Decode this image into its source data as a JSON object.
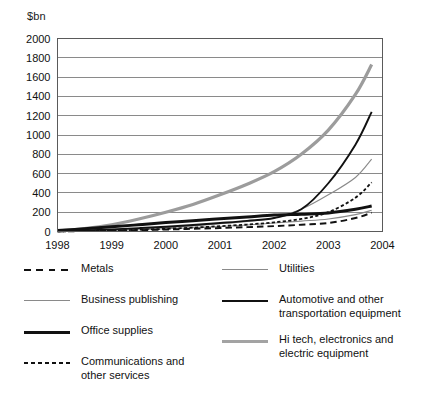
{
  "chart_data": {
    "type": "line",
    "title": "",
    "subtitle": "",
    "xlabel": "",
    "ylabel": "$bn",
    "grid": true,
    "legend_position": "bottom",
    "xlim": [
      1998,
      2004
    ],
    "ylim": [
      0,
      2000
    ],
    "x_ticks": [
      "1998",
      "1999",
      "2000",
      "2001",
      "2002",
      "2003",
      "2004"
    ],
    "y_ticks": [
      "0",
      "200",
      "400",
      "600",
      "800",
      "1000",
      "1200",
      "1400",
      "1600",
      "1800",
      "2000"
    ],
    "x": [
      1998,
      1998.5,
      1999,
      1999.5,
      2000,
      2000.5,
      2001,
      2001.5,
      2002,
      2002.5,
      2003,
      2003.5,
      2003.8
    ],
    "series": [
      {
        "name": "Hi tech, electronics and electric equipment",
        "style": "solid",
        "color": "#9c9c9c",
        "width": 3.2,
        "values": [
          5,
          30,
          70,
          130,
          200,
          280,
          380,
          490,
          620,
          800,
          1050,
          1420,
          1730
        ]
      },
      {
        "name": "Automotive and other transportation equipment",
        "style": "solid",
        "color": "#111111",
        "width": 1.9,
        "values": [
          5,
          12,
          22,
          35,
          50,
          68,
          88,
          110,
          140,
          230,
          500,
          900,
          1240
        ]
      },
      {
        "name": "Business publishing",
        "style": "solid",
        "color": "#8a8a8a",
        "width": 1.1,
        "values": [
          2,
          6,
          14,
          25,
          40,
          58,
          80,
          105,
          140,
          230,
          380,
          560,
          750
        ]
      },
      {
        "name": "Communications and other services",
        "style": "short-dash",
        "color": "#111111",
        "width": 1.8,
        "values": [
          2,
          5,
          10,
          18,
          28,
          40,
          55,
          72,
          95,
          130,
          200,
          350,
          510
        ]
      },
      {
        "name": "Office supplies",
        "style": "solid",
        "color": "#111111",
        "width": 3.0,
        "values": [
          10,
          28,
          48,
          70,
          92,
          112,
          132,
          150,
          170,
          180,
          192,
          230,
          265
        ]
      },
      {
        "name": "Utilities",
        "style": "solid",
        "color": "#8a8a8a",
        "width": 1.1,
        "values": [
          2,
          5,
          10,
          18,
          28,
          40,
          52,
          68,
          88,
          108,
          130,
          175,
          220
        ]
      },
      {
        "name": "Metals",
        "style": "long-dash",
        "color": "#111111",
        "width": 1.9,
        "values": [
          2,
          4,
          8,
          14,
          20,
          28,
          36,
          45,
          56,
          70,
          88,
          140,
          195
        ]
      }
    ]
  },
  "axis": {
    "y_title": "$bn"
  },
  "legend": {
    "left_column": [
      {
        "label": "Metals",
        "swatch": "long-dash-black"
      },
      {
        "label": "Business publishing",
        "swatch": "thin-gray"
      },
      {
        "label": "Office supplies",
        "swatch": "thick-black"
      },
      {
        "label": "Communications and\nother services",
        "swatch": "short-dash-black"
      }
    ],
    "right_column": [
      {
        "label": "Utilities",
        "swatch": "thin-gray"
      },
      {
        "label": "Automotive and other\ntransportation equipment",
        "swatch": "medium-black"
      },
      {
        "label": "Hi tech, electronics and\nelectric equipment",
        "swatch": "thick-gray"
      }
    ]
  }
}
